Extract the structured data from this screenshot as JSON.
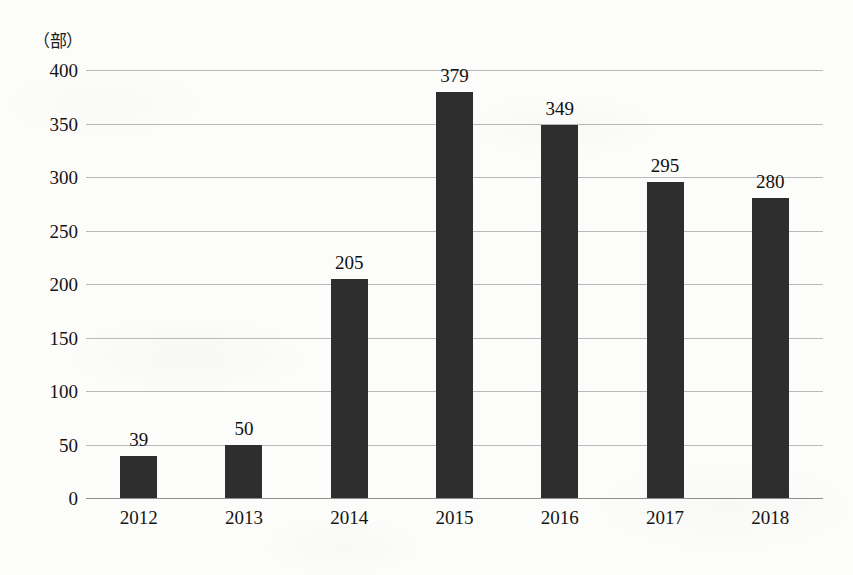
{
  "chart_data": {
    "type": "bar",
    "title": "",
    "subtitle": "",
    "xlabel": "",
    "ylabel": "",
    "unit_label": "（部）",
    "categories": [
      "2012",
      "2013",
      "2014",
      "2015",
      "2016",
      "2017",
      "2018"
    ],
    "values": [
      39,
      50,
      205,
      379,
      349,
      295,
      280
    ],
    "ylim": [
      0,
      400
    ],
    "ytick_step": 50,
    "yticks": [
      "0",
      "50",
      "100",
      "150",
      "200",
      "250",
      "300",
      "350",
      "400"
    ],
    "grid": true,
    "legend": false,
    "legend_position": "none",
    "bar_color": "#2e2e2e",
    "gridline_color": "#b9b9b9",
    "background_color": "#fcfcfa",
    "data_labels_shown": true
  }
}
